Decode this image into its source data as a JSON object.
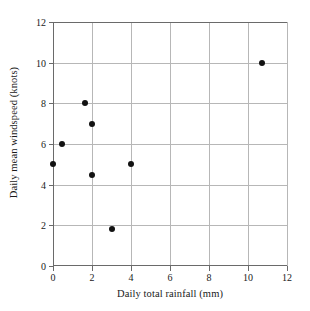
{
  "chart_data": {
    "type": "scatter",
    "title": "",
    "xlabel": "Daily total rainfall (mm)",
    "ylabel": "Daily mean windspeed (knots)",
    "xlim": [
      0,
      12
    ],
    "ylim": [
      0,
      12
    ],
    "xticks": [
      "0",
      "2",
      "4",
      "6",
      "8",
      "10",
      "12"
    ],
    "xtick_values": [
      0,
      2,
      4,
      6,
      8,
      10,
      12
    ],
    "yticks": [
      "0",
      "2",
      "4",
      "6",
      "8",
      "10",
      "12"
    ],
    "ytick_values": [
      0,
      2,
      4,
      6,
      8,
      10,
      12
    ],
    "grid": true,
    "legend": false,
    "marker": "filled-circle",
    "marker_color": "#121212",
    "grid_color": "#b7b7b7",
    "axis_color": "#6a6a6a",
    "background": "#ffffff",
    "points": [
      {
        "x": 0.0,
        "y": 5.0
      },
      {
        "x": 0.45,
        "y": 6.0
      },
      {
        "x": 1.65,
        "y": 8.0
      },
      {
        "x": 2.0,
        "y": 7.0
      },
      {
        "x": 2.0,
        "y": 4.5
      },
      {
        "x": 3.0,
        "y": 1.8
      },
      {
        "x": 4.0,
        "y": 5.0
      },
      {
        "x": 10.7,
        "y": 10.0
      }
    ]
  }
}
